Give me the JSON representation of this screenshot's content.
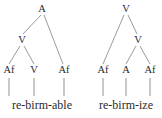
{
  "figure": {
    "background_color": "#ffffff",
    "ink_color": "#2b2b2b",
    "line_color": "#8f8f8f",
    "stem_color": "#9a9a9a"
  },
  "trees": [
    {
      "id": "left-tree",
      "word": "re-birm-able",
      "word_x": 42,
      "word_y": 105,
      "nodes": [
        {
          "id": "l-root",
          "label": "A",
          "x": 42,
          "y": 9
        },
        {
          "id": "l-v",
          "label": "V",
          "x": 22,
          "y": 40
        },
        {
          "id": "l-af1",
          "label": "Af",
          "x": 9,
          "y": 70
        },
        {
          "id": "l-v2",
          "label": "V",
          "x": 34,
          "y": 70
        },
        {
          "id": "l-af2",
          "label": "Af",
          "x": 64,
          "y": 70
        }
      ],
      "branches": [
        {
          "x1": 41,
          "y1": 15,
          "x2": 23,
          "y2": 34
        },
        {
          "x1": 44,
          "y1": 15,
          "x2": 63,
          "y2": 64
        },
        {
          "x1": 20,
          "y1": 46,
          "x2": 9,
          "y2": 64
        },
        {
          "x1": 24,
          "y1": 46,
          "x2": 34,
          "y2": 64
        }
      ],
      "stems": [
        {
          "x": 9,
          "y1": 78,
          "y2": 96
        },
        {
          "x": 34,
          "y1": 78,
          "y2": 96
        },
        {
          "x": 64,
          "y1": 78,
          "y2": 96
        }
      ]
    },
    {
      "id": "right-tree",
      "word": "re-birm-ize",
      "word_x": 126,
      "word_y": 105,
      "nodes": [
        {
          "id": "r-root",
          "label": "V",
          "x": 126,
          "y": 9
        },
        {
          "id": "r-v2",
          "label": "V",
          "x": 138,
          "y": 40
        },
        {
          "id": "r-af1",
          "label": "Af",
          "x": 103,
          "y": 70
        },
        {
          "id": "r-a",
          "label": "A",
          "x": 126,
          "y": 70
        },
        {
          "id": "r-af2",
          "label": "Af",
          "x": 150,
          "y": 70
        }
      ],
      "branches": [
        {
          "x1": 124,
          "y1": 15,
          "x2": 103,
          "y2": 64
        },
        {
          "x1": 128,
          "y1": 15,
          "x2": 137,
          "y2": 34
        },
        {
          "x1": 136,
          "y1": 46,
          "x2": 126,
          "y2": 64
        },
        {
          "x1": 140,
          "y1": 46,
          "x2": 150,
          "y2": 64
        }
      ],
      "stems": [
        {
          "x": 103,
          "y1": 78,
          "y2": 96
        },
        {
          "x": 126,
          "y1": 78,
          "y2": 96
        },
        {
          "x": 150,
          "y1": 78,
          "y2": 96
        }
      ]
    }
  ]
}
